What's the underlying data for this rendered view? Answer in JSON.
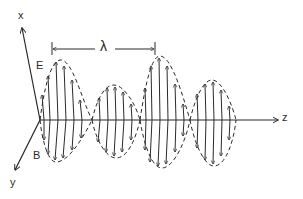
{
  "diagram": {
    "axes": {
      "x": "x",
      "y": "y",
      "z": "z"
    },
    "fields": {
      "electric": "E",
      "magnetic": "B"
    },
    "wavelength_label": "λ",
    "colors": {
      "ink": "#2a2a2a",
      "background": "#ffffff"
    }
  }
}
